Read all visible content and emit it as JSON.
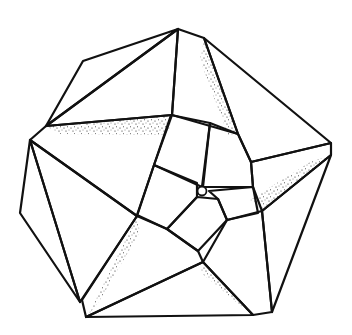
{
  "figure": {
    "description": "Line drawing of a pentagonal polyhedral assembly: outer folded triangular faces around a central pentagon of five hatched quadrilaterals with a small hole at the center; stippled shading along fold edges.",
    "stroke_color": "#111111",
    "background_color": "#ffffff",
    "hatch_patterns": [
      "horizontal",
      "vertical",
      "diagonal"
    ]
  }
}
